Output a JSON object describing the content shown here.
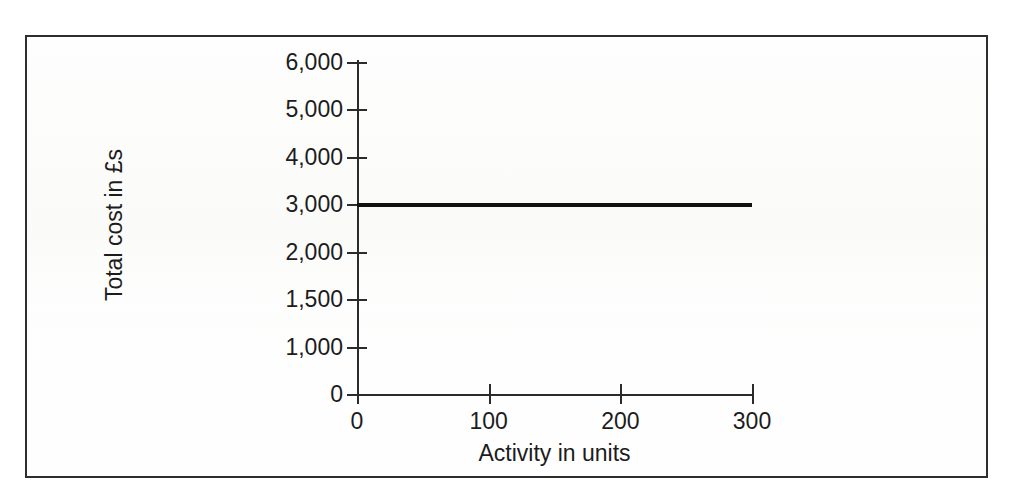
{
  "chart_data": {
    "type": "line",
    "title": "",
    "subtitle": "",
    "xlabel": "Activity in units",
    "ylabel": "Total cost in £s",
    "grid": false,
    "legend": null,
    "legend_position": "none",
    "xlim": [
      0,
      300
    ],
    "ylim": [
      0,
      6000
    ],
    "x_ticks": [
      {
        "value": 0,
        "label": "0"
      },
      {
        "value": 100,
        "label": "100"
      },
      {
        "value": 200,
        "label": "200"
      },
      {
        "value": 300,
        "label": "300"
      }
    ],
    "y_ticks": [
      {
        "value": 6000,
        "label": "6,000"
      },
      {
        "value": 5000,
        "label": "5,000"
      },
      {
        "value": 4000,
        "label": "4,000"
      },
      {
        "value": 3000,
        "label": "3,000"
      },
      {
        "value": 2000,
        "label": "2,000"
      },
      {
        "value": 1500,
        "label": "1,500"
      },
      {
        "value": 1000,
        "label": "1,000"
      },
      {
        "value": 0,
        "label": "0"
      }
    ],
    "y_axis_note": "tick labels are evenly spaced on the drawn axis even though the value steps are not uniform",
    "series": [
      {
        "name": "Total cost",
        "x": [
          0,
          100,
          200,
          300
        ],
        "values": [
          3000,
          3000,
          3000,
          3000
        ],
        "color": "#111111",
        "line_width": 4,
        "markers": false
      }
    ],
    "annotations": [],
    "axis_color": "#2b2b2b",
    "background_color": "#fefefe",
    "frame_color": "#2e2e2e"
  }
}
